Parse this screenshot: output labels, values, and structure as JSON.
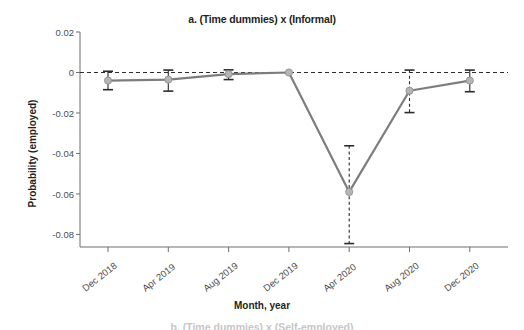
{
  "figure": {
    "title": "a. (Time dummies) x (Informal)",
    "partial_footer_title": "b. (Time dummies) x (Self-employed)"
  },
  "chart_data": {
    "type": "line",
    "title": "a. (Time dummies) x (Informal)",
    "xlabel": "Month, year",
    "ylabel": "Probability (employed)",
    "categories": [
      "Dec 2018",
      "Apr 2019",
      "Aug 2019",
      "Dec 2019",
      "Apr 2020",
      "Aug 2020",
      "Dec 2020"
    ],
    "values": [
      -0.004,
      -0.0035,
      -0.0008,
      0.0,
      -0.059,
      -0.009,
      -0.004
    ],
    "error_low": [
      -0.0085,
      -0.0092,
      -0.0035,
      0.0,
      -0.0845,
      -0.0198,
      -0.0095
    ],
    "error_high": [
      0.0006,
      0.0012,
      0.0013,
      0.0,
      -0.0362,
      0.0012,
      0.0012
    ],
    "yticks": [
      "0.02",
      "0",
      "-0.02",
      "-0.04",
      "-0.06",
      "-0.08"
    ],
    "ytick_values": [
      0.02,
      0,
      -0.02,
      -0.04,
      -0.06,
      -0.08
    ],
    "ylim": [
      -0.088,
      0.02
    ],
    "reference_line": 0,
    "reference_line_style": "dashed",
    "grid": false,
    "legend": "none",
    "series_name": "Time dummies x Informal",
    "colors": {
      "line": "#7d7d7d",
      "marker_fill": "#b5b5b5",
      "marker_edge": "#8c8c8c",
      "error_bar": "#2b2b2b",
      "axis": "#6f6f6f",
      "text": "#231f20",
      "tick_text": "#4d4d4d"
    }
  }
}
